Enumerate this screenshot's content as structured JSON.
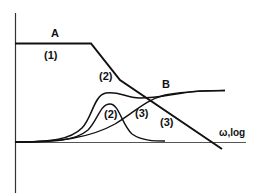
{
  "diagram": {
    "axes": {
      "x_label": "ω,log"
    },
    "curves": [
      {
        "id": "A",
        "label": "A",
        "description": "asymptotic line: flat then sloping down"
      },
      {
        "id": "B",
        "label": "B",
        "description": "total response curve rising to plateau"
      },
      {
        "id": "2",
        "label": "(2)",
        "description": "peaked contribution"
      },
      {
        "id": "3",
        "label": "(3)",
        "description": "sigmoid rising contribution"
      }
    ],
    "labels": {
      "A": "A",
      "B": "B",
      "region1": "(1)",
      "region2_upper": "(2)",
      "region2_lower": "(2)",
      "region3_left": "(3)",
      "region3_right": "(3)"
    },
    "colors": {
      "line": "#111111",
      "axis": "#333333",
      "background": "#ffffff"
    }
  }
}
